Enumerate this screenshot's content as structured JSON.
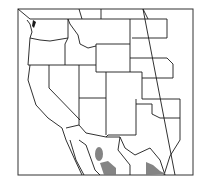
{
  "map": {
    "title": "",
    "region": "Western United States and northern Mexico",
    "frame": {
      "x": 18,
      "y": 9,
      "width": 175,
      "height": 166
    },
    "colors": {
      "background": "#ffffff",
      "borders": "#1a1a1a",
      "range": "#777777",
      "water": "#1a1a1a"
    },
    "range_areas": [
      {
        "name": "range-area-sonora-upper",
        "cx": 99,
        "cy": 153
      },
      {
        "name": "range-area-sonora-lower",
        "cx": 108,
        "cy": 170
      },
      {
        "name": "range-area-tamaulipas",
        "cx": 152,
        "cy": 170
      }
    ]
  }
}
